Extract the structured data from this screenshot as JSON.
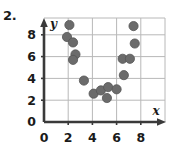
{
  "problem": {
    "number": "2."
  },
  "colors": {
    "point": "#6b6b6b",
    "point_edge": "#565656",
    "axis": "#3a3a3a",
    "grid": "#b8b8b8",
    "text": "#1a1a1a",
    "background": "#ffffff"
  },
  "chart_data": {
    "type": "scatter",
    "title": "",
    "subtitle": "",
    "xlabel": "x",
    "ylabel": "y",
    "xlim": [
      0,
      9
    ],
    "ylim": [
      0,
      9.6
    ],
    "xticks": [
      0,
      2,
      4,
      6,
      8
    ],
    "yticks": [
      0,
      2,
      4,
      6,
      8
    ],
    "xticklabels": [
      "0",
      "2",
      "4",
      "6",
      "8"
    ],
    "yticklabels": [
      "0",
      "2",
      "4",
      "6",
      "8"
    ],
    "grid": true,
    "grid_spacing": 2,
    "legend": null,
    "legend_position": "none",
    "marker": "circle",
    "marker_size": 6,
    "series": [
      {
        "name": "data",
        "points": [
          [
            2.1,
            8.9
          ],
          [
            1.9,
            7.8
          ],
          [
            2.4,
            7.3
          ],
          [
            2.6,
            6.2
          ],
          [
            2.4,
            5.7
          ],
          [
            3.3,
            3.8
          ],
          [
            4.1,
            2.6
          ],
          [
            4.7,
            2.9
          ],
          [
            5.3,
            3.2
          ],
          [
            5.2,
            2.2
          ],
          [
            6.0,
            3.0
          ],
          [
            6.6,
            4.3
          ],
          [
            6.5,
            5.8
          ],
          [
            7.1,
            5.8
          ],
          [
            7.5,
            7.2
          ],
          [
            7.4,
            8.8
          ]
        ]
      }
    ]
  },
  "axes_geometry": {
    "x0_px": 44,
    "y0_px": 122,
    "px_per_unit_x": 12.1,
    "px_per_unit_y": 10.9,
    "plot_right_px": 166,
    "plot_top_px": 18
  }
}
